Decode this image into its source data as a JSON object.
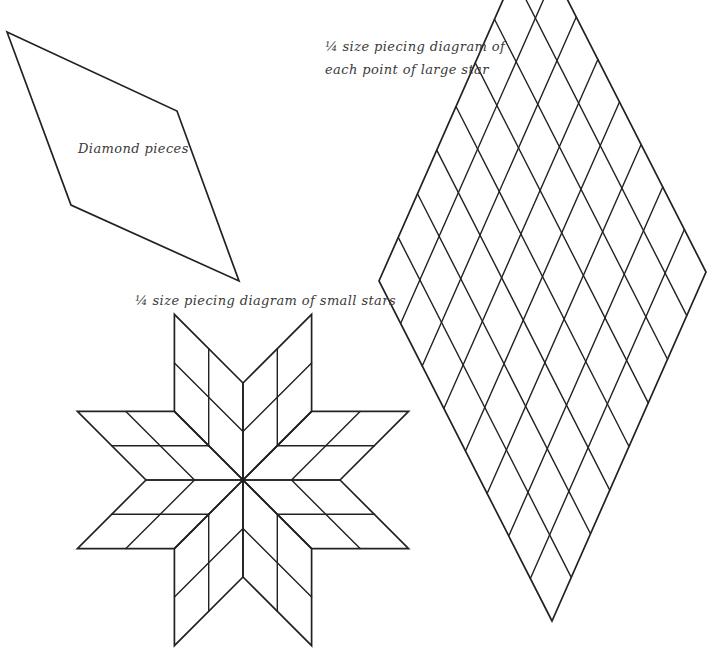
{
  "diagram": {
    "type": "quilt-piecing-diagram",
    "colors": {
      "background": "#ffffff",
      "line": "#222222",
      "text": "#3a3a3a"
    },
    "diamond_piece": {
      "label": "Diamond pieces"
    },
    "large_star_point": {
      "caption_line1": "¼ size piecing diagram of",
      "caption_line2": "each point of large star",
      "grid_divisions": 8
    },
    "small_star": {
      "caption": "¼ size piecing diagram of small stars",
      "points": 8,
      "grid_divisions_per_point": 2
    }
  }
}
